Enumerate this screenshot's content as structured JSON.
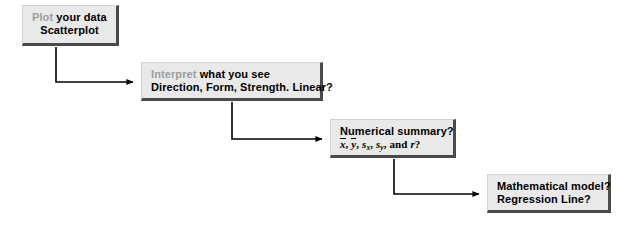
{
  "diagram": {
    "background_color": "#ffffff",
    "node_fill": "#e9e9e9",
    "node_shadow": "#4a4a4a",
    "lead_word_color": "#9c9c9c",
    "connector_color": "#000000",
    "nodes": [
      {
        "id": "plot",
        "lead": "Plot",
        "line1_rest": " your data",
        "line2": "Scatterplot"
      },
      {
        "id": "interpret",
        "lead": "Interpret",
        "line1_rest": " what you see",
        "line2": "Direction, Form, Strength. Linear?"
      },
      {
        "id": "numerical-summary",
        "line1": "Numerical summary?",
        "math": {
          "xbar": "x",
          "sep1": ", ",
          "ybar": "y",
          "sep2": ", ",
          "s": "s",
          "sub_x": "x",
          "sep3": ", ",
          "s2": "s",
          "sub_y": "y",
          "sep4": ", and ",
          "r": "r",
          "q": "?"
        },
        "line2_plain": "x, y, sx, sy, and r?"
      },
      {
        "id": "model",
        "line1": "Mathematical model?",
        "line2": "Regression Line?"
      }
    ],
    "connectors": [
      {
        "id": "plot-to-interpret",
        "from": "plot",
        "to": "interpret",
        "style": "elbow-down-right",
        "arrow": "right"
      },
      {
        "id": "interpret-to-numerical",
        "from": "interpret",
        "to": "numerical-summary",
        "style": "elbow-down-right",
        "arrow": "right"
      },
      {
        "id": "numerical-to-model",
        "from": "numerical-summary",
        "to": "model",
        "style": "elbow-down-right",
        "arrow": "right"
      }
    ]
  }
}
